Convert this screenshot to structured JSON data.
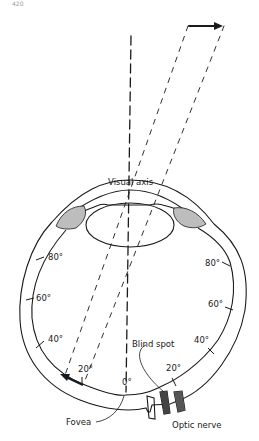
{
  "figure": {
    "page_number": "420",
    "labels": {
      "visual_axis": "Visual axis",
      "blind_spot": "Blind spot",
      "fovea": "Fovea",
      "optic_nerve": "Optic nerve"
    },
    "left_angles": [
      "80°",
      "60°",
      "40°",
      "20°"
    ],
    "right_angles": [
      "80°",
      "60°",
      "40°",
      "20°"
    ],
    "center_angle": "0°"
  }
}
